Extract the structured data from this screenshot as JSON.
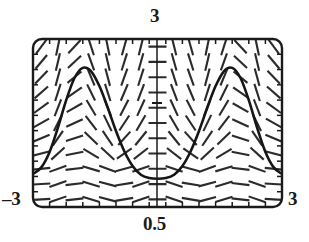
{
  "figure": {
    "kind": "slope-field-with-solution-curve",
    "frame": {
      "x_left_px": 33,
      "x_right_px": 282,
      "y_top_px": 39,
      "y_bottom_px": 207,
      "corner_radius_px": 9,
      "stroke_color": "#1a1a1a"
    },
    "axis_labels": {
      "top": "3",
      "bottom": "0.5",
      "left": "–3",
      "right": "3"
    },
    "vertical_axis": {
      "x_px": 157,
      "tick_y_px": 103,
      "tick_half_width_px": 5
    },
    "colors": {
      "ink": "#1a1a1a",
      "field_stroke": "#2b2b2b",
      "curve_stroke": "#161616",
      "background": "#ffffff"
    }
  },
  "chart_data": {
    "type": "line",
    "title": "",
    "subtitle": "",
    "xlabel": "",
    "ylabel": "",
    "xlim": [
      -3,
      3
    ],
    "ylim": [
      0.5,
      3
    ],
    "xticks": [
      -3,
      3
    ],
    "xticklabels": [
      "-3",
      "3"
    ],
    "yticks": [
      0.5,
      3
    ],
    "yticklabels": [
      "0.5",
      "3"
    ],
    "grid": false,
    "legend": null,
    "annotations": [
      {
        "text": "3",
        "position": "top-center",
        "kind": "y-axis-max"
      },
      {
        "text": "0.5",
        "position": "bottom-center",
        "kind": "y-axis-min"
      },
      {
        "text": "-3",
        "position": "bottom-left",
        "kind": "x-axis-min"
      },
      {
        "text": "3",
        "position": "bottom-right",
        "kind": "x-axis-max"
      }
    ],
    "series": [
      {
        "name": "solution curve",
        "x": [
          -3.0,
          -2.8,
          -2.6,
          -2.4,
          -2.2,
          -2.0,
          -1.8,
          -1.6,
          -1.4,
          -1.2,
          -1.0,
          -0.8,
          -0.6,
          -0.4,
          -0.2,
          0.0,
          0.2,
          0.4,
          0.6,
          0.8,
          1.0,
          1.2,
          1.4,
          1.6,
          1.8,
          2.0,
          2.2,
          2.4,
          2.6,
          2.8,
          3.0
        ],
        "y": [
          0.99,
          1.09,
          1.32,
          1.68,
          2.09,
          2.42,
          2.57,
          2.52,
          2.3,
          1.98,
          1.63,
          1.33,
          1.11,
          0.98,
          0.93,
          0.92,
          0.93,
          0.98,
          1.11,
          1.33,
          1.63,
          1.98,
          2.3,
          2.52,
          2.57,
          2.42,
          2.09,
          1.68,
          1.32,
          1.09,
          0.99
        ]
      }
    ],
    "field": {
      "description": "direction field of short dashes on a regular grid; slopes positive on rising flanks and negative on falling flanks, nearly horizontal near the bottom",
      "columns": 15,
      "rows": 11
    }
  }
}
